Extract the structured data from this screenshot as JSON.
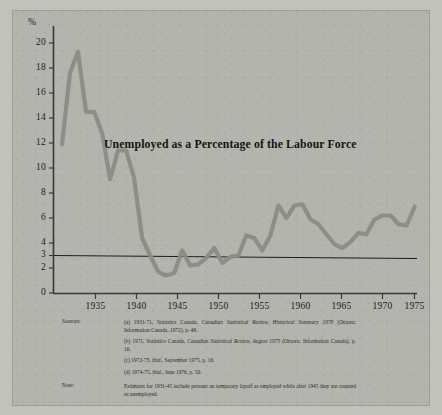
{
  "figure": {
    "title": "Unemployed as a Percentage of the Labour Force",
    "percent_symbol": "%"
  },
  "chart_data": {
    "type": "line",
    "title": "Unemployed as a Percentage of the Labour Force",
    "xlabel": "",
    "ylabel": "%",
    "xlim": [
      1931,
      1975
    ],
    "ylim": [
      0,
      21
    ],
    "grid": false,
    "legend": "none",
    "line_color": "#8c8c86",
    "reference_line": {
      "value": 3,
      "label": "3",
      "color": "#1d1d1a",
      "note": "horizontal rule drawn at 3 per cent"
    },
    "ytick_labels": [
      "20",
      "18",
      "16",
      "14",
      "12",
      "10",
      "8",
      "6",
      "4",
      "3",
      "2",
      "0"
    ],
    "yticks": [
      20,
      18,
      16,
      14,
      12,
      10,
      8,
      6,
      4,
      3,
      2,
      0
    ],
    "xtick_labels": [
      "1935",
      "1940",
      "1945",
      "1950",
      "1955",
      "1960",
      "1965",
      "1970",
      "1975"
    ],
    "xticks": [
      1935,
      1940,
      1945,
      1950,
      1955,
      1960,
      1965,
      1970,
      1975
    ],
    "x": [
      1931,
      1932,
      1933,
      1934,
      1935,
      1936,
      1937,
      1938,
      1939,
      1940,
      1941,
      1942,
      1943,
      1944,
      1945,
      1946,
      1947,
      1948,
      1949,
      1950,
      1951,
      1952,
      1953,
      1954,
      1955,
      1956,
      1957,
      1958,
      1959,
      1960,
      1961,
      1962,
      1963,
      1964,
      1965,
      1966,
      1967,
      1968,
      1969,
      1970,
      1971,
      1972,
      1973,
      1974,
      1975
    ],
    "values": [
      11.9,
      17.6,
      19.3,
      14.5,
      14.5,
      12.8,
      9.1,
      11.4,
      11.4,
      9.2,
      4.4,
      3.0,
      1.7,
      1.4,
      1.6,
      3.4,
      2.2,
      2.3,
      2.8,
      3.6,
      2.4,
      2.9,
      3.0,
      4.6,
      4.4,
      3.4,
      4.6,
      7.0,
      6.0,
      7.0,
      7.1,
      5.9,
      5.5,
      4.7,
      3.9,
      3.6,
      4.1,
      4.8,
      4.7,
      5.9,
      6.2,
      6.2,
      5.5,
      5.4,
      6.9
    ],
    "units": "per cent"
  },
  "sources": {
    "label": "Sources:",
    "items": [
      {
        "marker": "(a)",
        "text_before": " 1931-71, Statistics Canada, ",
        "italic": "Canadian Statistical Review, Historical Summary 1970",
        "text_after": " (Ottawa: Information Canada, 1972), p. 48."
      },
      {
        "marker": "(b)",
        "text_before": " 1971, Statistics Canada, ",
        "italic": "Canadian Statistical Review, August 1975",
        "text_after": " (Ottawa: Information Canada), p. 16."
      },
      {
        "marker": "(c)",
        "text_before": " 1972-73, ",
        "italic": "ibid.",
        "text_after": ", September 1975, p. 16."
      },
      {
        "marker": "(d)",
        "text_before": " 1974-75, ",
        "italic": "ibid.",
        "text_after": ", June 1976, p. 50."
      }
    ]
  },
  "note": {
    "label": "Note:",
    "text": "Estimates for 1931-45 include persons on temporary layoff as employed while after 1945 they are counted as unemployed."
  }
}
